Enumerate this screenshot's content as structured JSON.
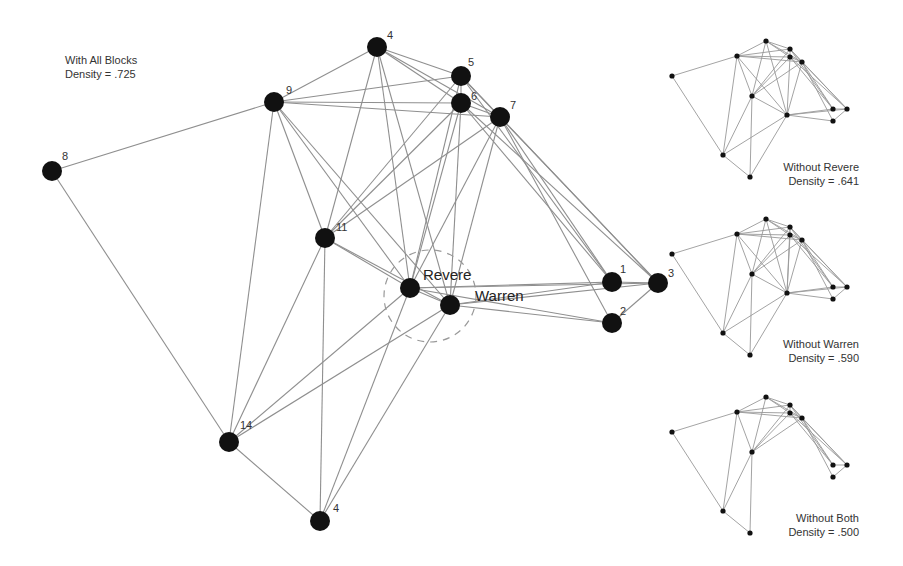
{
  "main_graph": {
    "title": "With All Blocks",
    "density_label": "Density = .725",
    "nodes": [
      {
        "id": "n4t",
        "label": "4",
        "x": 377,
        "y": 47,
        "lx": 387,
        "ly": 39
      },
      {
        "id": "n5",
        "label": "5",
        "x": 461,
        "y": 76,
        "lx": 468,
        "ly": 66
      },
      {
        "id": "n6",
        "label": "6",
        "x": 461,
        "y": 103,
        "lx": 471,
        "ly": 100
      },
      {
        "id": "n7",
        "label": "7",
        "x": 500,
        "y": 117,
        "lx": 510,
        "ly": 109
      },
      {
        "id": "n9",
        "label": "9",
        "x": 274,
        "y": 102,
        "lx": 286,
        "ly": 94
      },
      {
        "id": "n8",
        "label": "8",
        "x": 52,
        "y": 171,
        "lx": 62,
        "ly": 160
      },
      {
        "id": "n11",
        "label": "11",
        "x": 325,
        "y": 238,
        "lx": 336,
        "ly": 231
      },
      {
        "id": "rev",
        "label": "Revere",
        "x": 410,
        "y": 288,
        "lx": 423,
        "ly": 280,
        "big": true
      },
      {
        "id": "war",
        "label": "Warren",
        "x": 450,
        "y": 305,
        "lx": 475,
        "ly": 301,
        "big": true
      },
      {
        "id": "n1",
        "label": "1",
        "x": 612,
        "y": 282,
        "lx": 620,
        "ly": 273
      },
      {
        "id": "n3",
        "label": "3",
        "x": 658,
        "y": 283,
        "lx": 668,
        "ly": 277
      },
      {
        "id": "n2",
        "label": "2",
        "x": 612,
        "y": 323,
        "lx": 620,
        "ly": 315
      },
      {
        "id": "n14",
        "label": "14",
        "x": 229,
        "y": 442,
        "lx": 240,
        "ly": 429
      },
      {
        "id": "n4b",
        "label": "4",
        "x": 320,
        "y": 521,
        "lx": 333,
        "ly": 512
      }
    ],
    "edges": [
      [
        "n8",
        "n9"
      ],
      [
        "n8",
        "n14"
      ],
      [
        "n9",
        "n4t"
      ],
      [
        "n9",
        "n5"
      ],
      [
        "n9",
        "n6"
      ],
      [
        "n9",
        "n7"
      ],
      [
        "n9",
        "n11"
      ],
      [
        "n9",
        "rev"
      ],
      [
        "n9",
        "war"
      ],
      [
        "n9",
        "n14"
      ],
      [
        "n4t",
        "n5"
      ],
      [
        "n4t",
        "n6"
      ],
      [
        "n4t",
        "n7"
      ],
      [
        "n4t",
        "n11"
      ],
      [
        "n4t",
        "rev"
      ],
      [
        "n4t",
        "war"
      ],
      [
        "n5",
        "n6"
      ],
      [
        "n5",
        "n7"
      ],
      [
        "n5",
        "n11"
      ],
      [
        "n5",
        "rev"
      ],
      [
        "n5",
        "n1"
      ],
      [
        "n5",
        "n3"
      ],
      [
        "n6",
        "n7"
      ],
      [
        "n6",
        "n11"
      ],
      [
        "n6",
        "rev"
      ],
      [
        "n6",
        "war"
      ],
      [
        "n6",
        "n1"
      ],
      [
        "n6",
        "n3"
      ],
      [
        "n7",
        "n11"
      ],
      [
        "n7",
        "rev"
      ],
      [
        "n7",
        "war"
      ],
      [
        "n7",
        "n1"
      ],
      [
        "n7",
        "n3"
      ],
      [
        "n7",
        "n2"
      ],
      [
        "n11",
        "rev"
      ],
      [
        "n11",
        "war"
      ],
      [
        "n11",
        "n14"
      ],
      [
        "n11",
        "n4b"
      ],
      [
        "rev",
        "war"
      ],
      [
        "rev",
        "n1"
      ],
      [
        "rev",
        "n3"
      ],
      [
        "rev",
        "n2"
      ],
      [
        "rev",
        "n14"
      ],
      [
        "rev",
        "n4b"
      ],
      [
        "war",
        "n1"
      ],
      [
        "war",
        "n3"
      ],
      [
        "war",
        "n2"
      ],
      [
        "war",
        "n14"
      ],
      [
        "war",
        "n4b"
      ],
      [
        "n1",
        "n3"
      ],
      [
        "n2",
        "n3"
      ],
      [
        "n14",
        "n4b"
      ]
    ],
    "highlight_circle": {
      "cx": 430,
      "cy": 296,
      "r": 46
    }
  },
  "side_graphs": [
    {
      "name": "without-revere",
      "title": "Without Revere",
      "density_label": "Density = .641",
      "offset_y": 0,
      "removed": [
        "rev"
      ]
    },
    {
      "name": "without-warren",
      "title": "Without Warren",
      "density_label": "Density = .590",
      "offset_y": 178,
      "removed": [
        "war"
      ]
    },
    {
      "name": "without-both",
      "title": "Without Both",
      "density_label": "Density = .500",
      "offset_y": 356,
      "removed": [
        "rev",
        "war"
      ]
    }
  ],
  "side_node_positions": {
    "n4t": [
      766,
      41
    ],
    "n5": [
      790,
      49
    ],
    "n6": [
      790,
      57
    ],
    "n7": [
      802,
      62
    ],
    "n9": [
      737,
      56
    ],
    "n8": [
      672,
      76
    ],
    "n11": [
      752,
      96
    ],
    "rev": [
      787,
      115
    ],
    "war": [
      787,
      115
    ],
    "n1": [
      833,
      109
    ],
    "n3": [
      847,
      109
    ],
    "n2": [
      833,
      121
    ],
    "n14": [
      723,
      155
    ],
    "n4b": [
      750,
      177
    ]
  },
  "side_captions": [
    {
      "title": "Without Revere",
      "density": "Density = .641",
      "top": 160
    },
    {
      "title": "Without Warren",
      "density": "Density = .590",
      "top": 337
    },
    {
      "title": "Without Both",
      "density": "Density = .500",
      "top": 511
    }
  ]
}
